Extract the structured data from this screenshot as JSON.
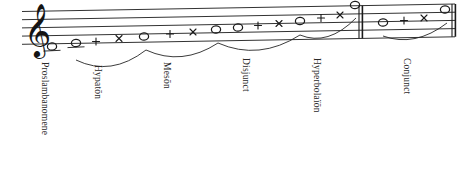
{
  "figure": {
    "clef": "treble-clef",
    "staff": {
      "line_count": 5,
      "left_x": 22,
      "right_x": 455,
      "left_top_y": 11.5,
      "right_top_y": 4.0,
      "line_gap": 8.2,
      "color": "#1b1b1b"
    },
    "barlines": [
      {
        "name": "double-barline-middle",
        "x": 359.0,
        "style": "double"
      },
      {
        "name": "double-barline-end",
        "x": 452.0,
        "style": "double"
      }
    ],
    "symbol_legend": {
      "circle": "whole-note-head",
      "plus": "plus-mark",
      "cross": "cross-mark"
    },
    "marks": [
      {
        "x": 52,
        "y": 55.5,
        "type": "circle",
        "ledger": true
      },
      {
        "x": 76,
        "y": 52.0,
        "type": "circle",
        "ledger": true
      },
      {
        "x": 96,
        "y": 50.5,
        "type": "plus",
        "ledger": false
      },
      {
        "x": 119,
        "y": 47.5,
        "type": "cross",
        "ledger": false
      },
      {
        "x": 144,
        "y": 45.5,
        "type": "circle",
        "ledger": false
      },
      {
        "x": 170,
        "y": 43.0,
        "type": "plus",
        "ledger": false
      },
      {
        "x": 193,
        "y": 41.0,
        "type": "cross",
        "ledger": false
      },
      {
        "x": 216,
        "y": 38.5,
        "type": "circle",
        "ledger": false
      },
      {
        "x": 238,
        "y": 36.5,
        "type": "circle",
        "ledger": false
      },
      {
        "x": 258,
        "y": 34.5,
        "type": "plus",
        "ledger": false
      },
      {
        "x": 279,
        "y": 32.5,
        "type": "cross",
        "ledger": false
      },
      {
        "x": 300,
        "y": 30.0,
        "type": "circle",
        "ledger": false
      },
      {
        "x": 321,
        "y": 27.0,
        "type": "plus",
        "ledger": false
      },
      {
        "x": 340,
        "y": 24.0,
        "type": "cross",
        "ledger": false
      },
      {
        "x": 355,
        "y": 14.0,
        "type": "circle",
        "ledger": false
      },
      {
        "x": 383,
        "y": 31.5,
        "type": "circle",
        "ledger": false
      },
      {
        "x": 404,
        "y": 29.5,
        "type": "plus",
        "ledger": false
      },
      {
        "x": 424,
        "y": 27.0,
        "type": "cross",
        "ledger": false
      },
      {
        "x": 445,
        "y": 18.5,
        "type": "circle",
        "ledger": false
      }
    ],
    "slurs": [
      {
        "name": "slur-hypaton",
        "x1": 76,
        "y1": 60,
        "x2": 146,
        "y2": 50,
        "dip": 22
      },
      {
        "name": "slur-meson",
        "x1": 146,
        "y1": 50,
        "x2": 218,
        "y2": 43,
        "dip": 20
      },
      {
        "name": "slur-disjunct",
        "x1": 218,
        "y1": 43,
        "x2": 300,
        "y2": 35,
        "dip": 22
      },
      {
        "name": "slur-hyperbolaion",
        "x1": 300,
        "y1": 35,
        "x2": 356,
        "y2": 18,
        "dip": 20
      },
      {
        "name": "slur-conjunct",
        "x1": 383,
        "y1": 36,
        "x2": 447,
        "y2": 23,
        "dip": 18
      }
    ],
    "labels": [
      {
        "name": "label-proslambanomene",
        "text": "Proslambanomene",
        "x": 50,
        "y": 62
      },
      {
        "name": "label-hypaton",
        "text": "Hypatōn",
        "x": 103,
        "y": 65
      },
      {
        "name": "label-meson",
        "text": "Mesōn",
        "x": 172,
        "y": 62
      },
      {
        "name": "label-disjunct",
        "text": "Disjunct",
        "x": 251,
        "y": 58
      },
      {
        "name": "label-hyperbolaion",
        "text": "Hyperbolaïōn",
        "x": 322,
        "y": 58
      },
      {
        "name": "label-conjunct",
        "text": "Conjunct",
        "x": 412,
        "y": 58
      }
    ]
  }
}
